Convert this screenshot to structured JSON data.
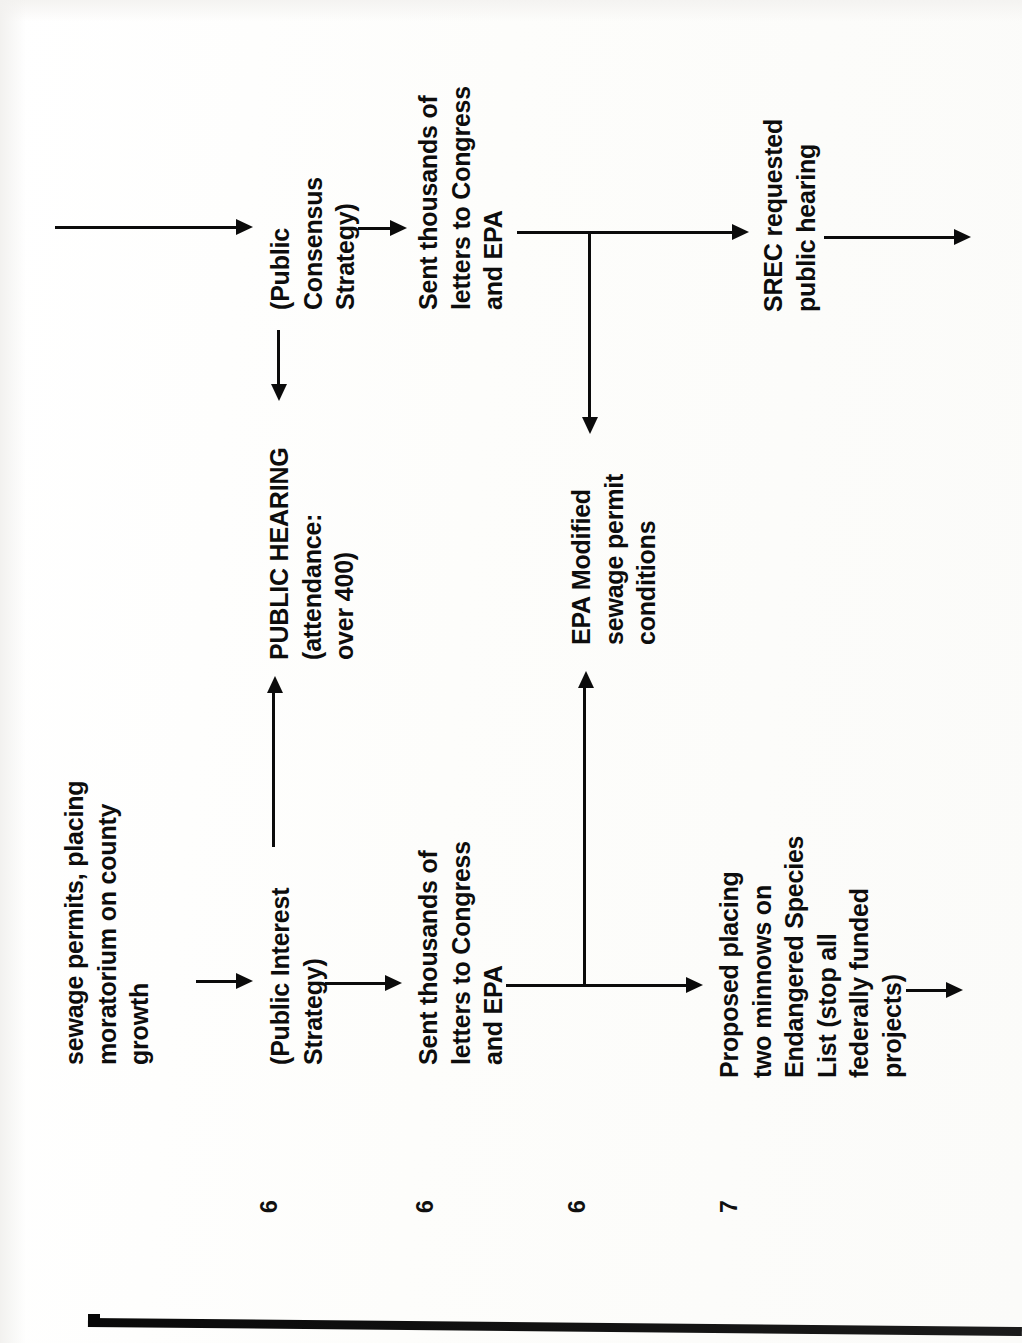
{
  "document": {
    "type": "flowchart-timeline",
    "orientation": "rotated-90-ccw",
    "background_color": "#fdfdfc",
    "ink_color": "#0b0b0b"
  },
  "nodes": [
    {
      "id": "sewage-permits",
      "lines": [
        "sewage permits, placing",
        "moratorium on county",
        "growth"
      ],
      "text": "sewage permits, placing moratorium on county growth"
    },
    {
      "id": "public-interest-strategy",
      "lines": [
        "(Public Interest",
        "Strategy)"
      ],
      "text": "(Public Interest Strategy)"
    },
    {
      "id": "sent-letters-lower",
      "lines": [
        "Sent thousands of",
        "letters to Congress",
        "and EPA"
      ],
      "text": "Sent thousands of letters to Congress and EPA"
    },
    {
      "id": "proposed-minnows",
      "lines": [
        "Proposed placing",
        "two minnows on",
        "Endangered Species",
        "List (stop all",
        "federally funded",
        "projects)"
      ],
      "text": "Proposed placing two minnows on Endangered Species List (stop all federally funded projects)"
    },
    {
      "id": "public-hearing",
      "lines": [
        "PUBLIC HEARING",
        "(attendance:",
        "over 400)"
      ],
      "text": "PUBLIC HEARING (attendance: over 400)"
    },
    {
      "id": "public-consensus-strategy",
      "lines": [
        "(Public",
        "Consensus",
        "Strategy)"
      ],
      "text": "(Public Consensus Strategy)"
    },
    {
      "id": "sent-letters-upper",
      "lines": [
        "Sent thousands of",
        "letters to Congress",
        "and EPA"
      ],
      "text": "Sent thousands of letters to Congress and EPA"
    },
    {
      "id": "epa-modified",
      "lines": [
        "EPA Modified",
        "sewage permit",
        "conditions"
      ],
      "text": "EPA Modified sewage permit conditions"
    },
    {
      "id": "srec-hearing",
      "lines": [
        "SREC requested",
        "public hearing"
      ],
      "text": "SREC requested public hearing"
    }
  ],
  "page_marks": [
    {
      "label": "6"
    },
    {
      "label": "6"
    },
    {
      "label": "6"
    },
    {
      "label": "7"
    }
  ],
  "connectors": [
    {
      "id": "arrow-sewage-to-interest",
      "direction": "right"
    },
    {
      "id": "arrow-interest-to-letters-lower",
      "direction": "right"
    },
    {
      "id": "arrow-letters-lower-to-minnows",
      "direction": "right"
    },
    {
      "id": "arrow-minnows-continue",
      "direction": "right"
    },
    {
      "id": "arrow-interest-up-to-hearing",
      "direction": "up"
    },
    {
      "id": "arrow-junction-up-to-epa",
      "direction": "up"
    },
    {
      "id": "arrow-hearing-long-to-consensus",
      "direction": "right"
    },
    {
      "id": "arrow-consensus-to-letters-upper",
      "direction": "right"
    },
    {
      "id": "arrow-consensus-down-to-hearing",
      "direction": "down"
    },
    {
      "id": "arrow-letters-upper-to-srec",
      "direction": "right"
    },
    {
      "id": "arrow-junction-down-to-epa",
      "direction": "down"
    },
    {
      "id": "arrow-srec-continue",
      "direction": "right"
    }
  ]
}
